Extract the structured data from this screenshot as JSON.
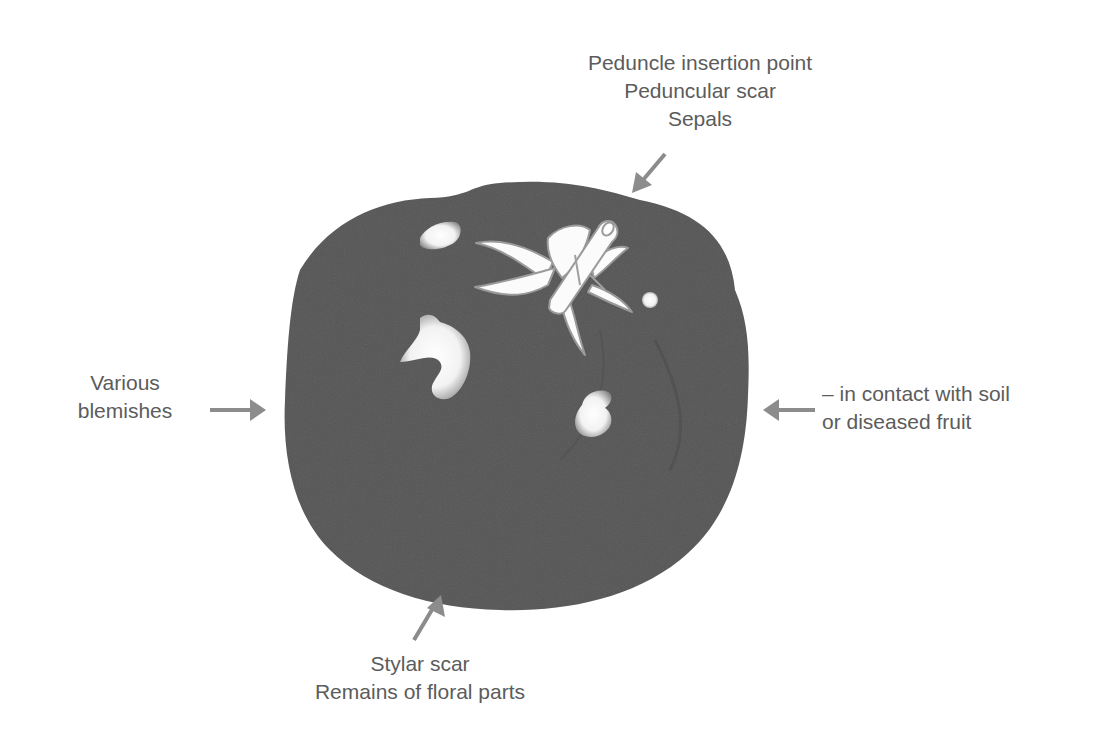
{
  "diagram": {
    "type": "annotated-illustration",
    "colors": {
      "fruit": "#555555",
      "highlight": "#f4f4f4",
      "arrow": "#8c8c8c",
      "text": "#5c5c5c",
      "background": "#ffffff"
    },
    "labels": {
      "top": {
        "lines": [
          "Peduncle insertion point",
          "Peduncular scar",
          "Sepals"
        ],
        "arrow_direction": "down-left"
      },
      "left": {
        "lines": [
          "Various",
          "blemishes"
        ],
        "arrow_direction": "right"
      },
      "right": {
        "lines": [
          "– in contact with soil",
          "or diseased fruit"
        ],
        "arrow_direction": "left"
      },
      "bottom": {
        "lines": [
          "Stylar scar",
          "Remains of floral parts"
        ],
        "arrow_direction": "up-right"
      }
    }
  }
}
